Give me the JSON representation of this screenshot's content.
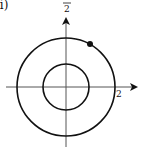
{
  "figure": {
    "part_label": "ii)",
    "top_axis_label_denominator": "2",
    "right_axis_label": "2",
    "colors": {
      "stroke": "#111111",
      "axis": "#444444",
      "background": "#ffffff"
    },
    "geometry": {
      "center": [
        66,
        87
      ],
      "outer_radius": 49,
      "inner_radius": 23,
      "point": [
        90,
        44
      ]
    }
  }
}
